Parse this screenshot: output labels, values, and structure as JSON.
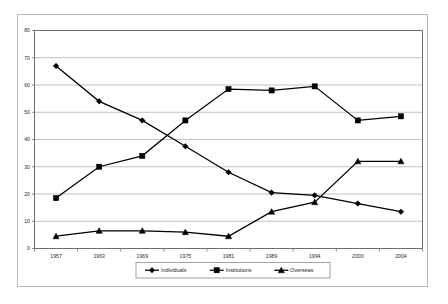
{
  "chart_data": {
    "type": "line",
    "title": "",
    "subtitle": "",
    "xlabel": "",
    "ylabel": "",
    "categories": [
      "1957",
      "1963",
      "1969",
      "1975",
      "1981",
      "1989",
      "1994",
      "2000",
      "2004"
    ],
    "ylim": [
      0,
      80
    ],
    "ytick_step": 10,
    "yticks": [
      "0",
      "10",
      "20",
      "30",
      "40",
      "50",
      "60",
      "70",
      "80"
    ],
    "grid": "horizontal",
    "legend_position": "bottom",
    "series": [
      {
        "name": "Individuals",
        "marker": "diamond",
        "color": "#000000",
        "values": [
          67,
          54,
          47,
          37.5,
          28,
          20.5,
          19.5,
          16.5,
          13.5
        ]
      },
      {
        "name": "Institutions",
        "marker": "square",
        "color": "#000000",
        "values": [
          18.5,
          30,
          34,
          47,
          58.5,
          58,
          59.5,
          47,
          48.5
        ]
      },
      {
        "name": "Overseas",
        "marker": "triangle",
        "color": "#000000",
        "values": [
          4.5,
          6.5,
          6.5,
          6,
          4.5,
          13.5,
          17,
          32,
          32
        ]
      }
    ],
    "annotations": []
  },
  "legend": {
    "entries": [
      {
        "label": "Individuals",
        "marker": "diamond"
      },
      {
        "label": "Institutions",
        "marker": "square"
      },
      {
        "label": "Overseas",
        "marker": "triangle"
      }
    ]
  }
}
